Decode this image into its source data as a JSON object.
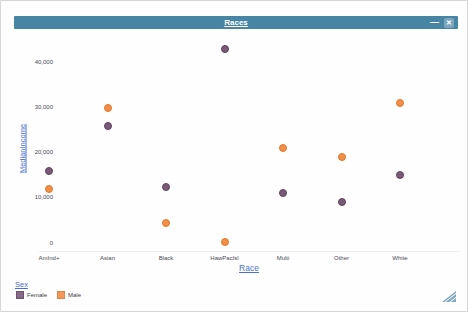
{
  "window": {
    "title": "Races",
    "minimize_glyph": "—",
    "close_glyph": "✕",
    "titlebar_color": "#4884a4"
  },
  "chart_data": {
    "type": "scatter",
    "title": "Races",
    "xlabel": "Race",
    "ylabel": "MedianIncome",
    "legend_title": "Sex",
    "legend_position": "bottom-left",
    "grid": false,
    "categories": [
      "AmInd+",
      "Asian",
      "Black",
      "HawPacIsl",
      "Multi",
      "Other",
      "White"
    ],
    "series": [
      {
        "name": "Female",
        "color": "#7b5a78",
        "border_color": "#5e4160",
        "values": [
          16000,
          26000,
          12500,
          43000,
          11000,
          9000,
          15000
        ]
      },
      {
        "name": "Male",
        "color": "#f28e47",
        "border_color": "#e07a2e",
        "values": [
          12000,
          30000,
          4500,
          300,
          21000,
          19000,
          31000
        ]
      }
    ],
    "ylim": [
      0,
      45000
    ],
    "yticks": [
      0,
      10000,
      20000,
      30000,
      40000
    ],
    "ytick_labels": [
      "0",
      "10,000",
      "20,000",
      "30,000",
      "40,000"
    ]
  }
}
